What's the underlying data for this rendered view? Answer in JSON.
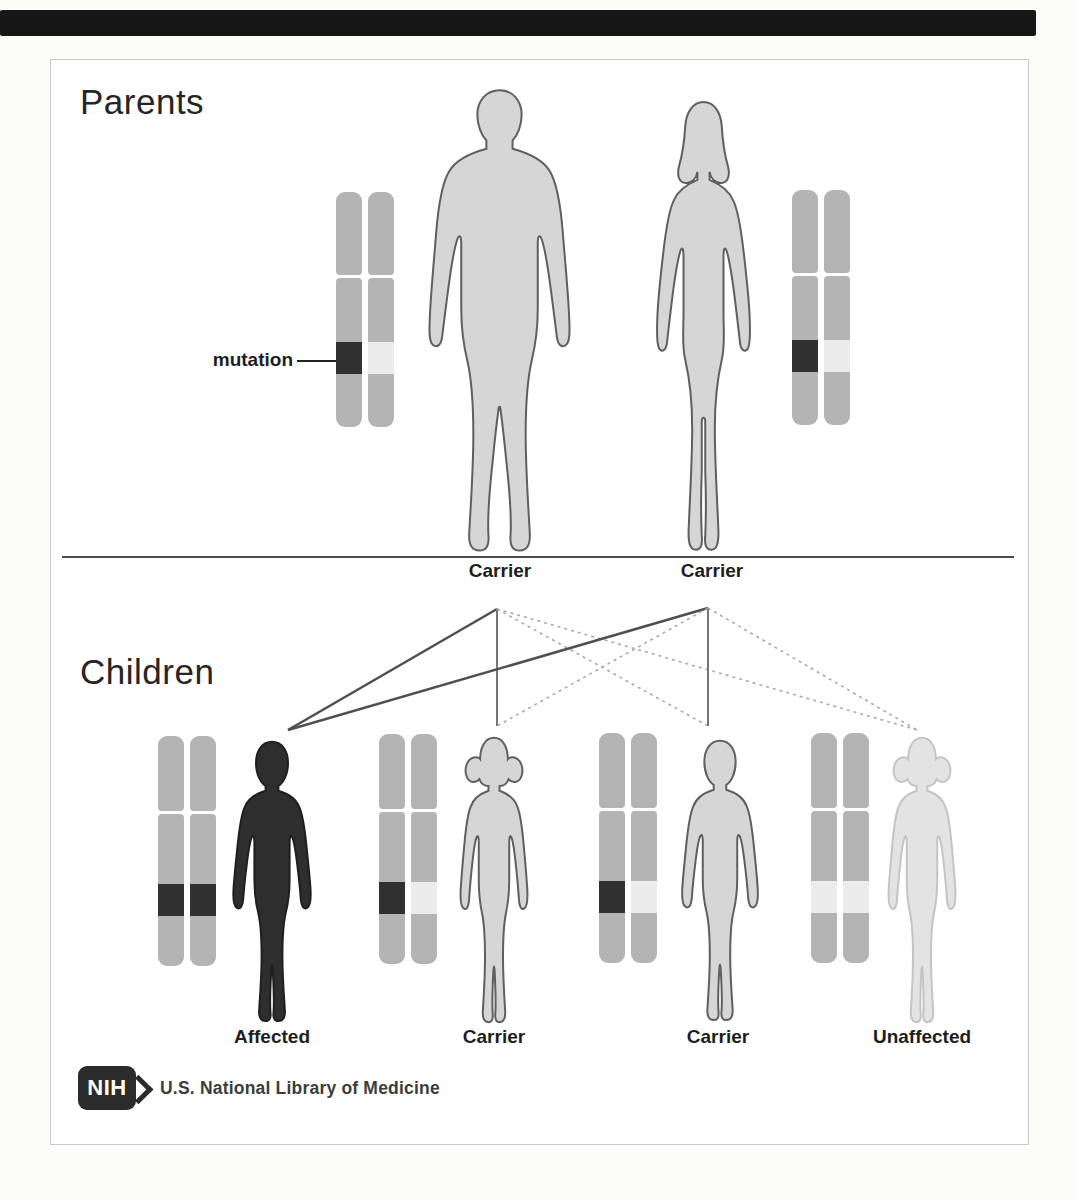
{
  "parents": {
    "heading": "Parents",
    "mutation_label": "mutation",
    "father": {
      "label": "Carrier",
      "sex": "male",
      "chromosomes": [
        "mutated",
        "normal"
      ]
    },
    "mother": {
      "label": "Carrier",
      "sex": "female",
      "chromosomes": [
        "mutated",
        "normal"
      ]
    }
  },
  "children": {
    "heading": "Children",
    "items": [
      {
        "label": "Affected",
        "sex": "male",
        "chromosomes": [
          "mutated",
          "mutated"
        ]
      },
      {
        "label": "Carrier",
        "sex": "female",
        "chromosomes": [
          "mutated",
          "normal"
        ]
      },
      {
        "label": "Carrier",
        "sex": "male",
        "chromosomes": [
          "mutated",
          "normal"
        ]
      },
      {
        "label": "Unaffected",
        "sex": "female",
        "chromosomes": [
          "normal",
          "normal"
        ]
      }
    ]
  },
  "transmissions": [
    {
      "from": "father",
      "to": "child-1-affected",
      "chromosome": "mutated",
      "line_style": "solid-dark"
    },
    {
      "from": "father",
      "to": "child-2-carrier",
      "chromosome": "mutated",
      "line_style": "solid"
    },
    {
      "from": "father",
      "to": "child-3-carrier",
      "chromosome": "normal",
      "line_style": "dotted"
    },
    {
      "from": "father",
      "to": "child-4-unaffected",
      "chromosome": "normal",
      "line_style": "dotted"
    },
    {
      "from": "mother",
      "to": "child-1-affected",
      "chromosome": "mutated",
      "line_style": "solid-dark"
    },
    {
      "from": "mother",
      "to": "child-2-carrier",
      "chromosome": "normal",
      "line_style": "dotted"
    },
    {
      "from": "mother",
      "to": "child-3-carrier",
      "chromosome": "mutated",
      "line_style": "solid"
    },
    {
      "from": "mother",
      "to": "child-4-unaffected",
      "chromosome": "normal",
      "line_style": "dotted"
    }
  ],
  "footer": {
    "nih_acronym": "NIH",
    "library_text": "U.S. National Library of Medicine"
  },
  "colors": {
    "chromosome_body": "#b4b4b4",
    "mutation_band": "#303030",
    "normal_band": "#ececec",
    "affected_fill": "#2e2e2e",
    "carrier_fill": "#d6d6d6",
    "unaffected_fill": "#e3e3e3",
    "solid_dark_line": "#4f4f4f",
    "solid_line": "#757575",
    "dotted_line": "#aaaaaa"
  }
}
